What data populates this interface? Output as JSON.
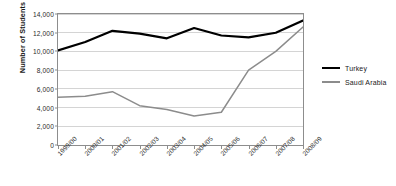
{
  "chart_data": {
    "type": "line",
    "title": "",
    "xlabel": "",
    "ylabel": "Number of Students",
    "categories": [
      "1999/00",
      "2000/01",
      "2001/02",
      "2002/03",
      "2003/04",
      "2004/05",
      "2005/06",
      "2006/07",
      "2007/08",
      "2008/09"
    ],
    "series": [
      {
        "name": "Turkey",
        "color": "#000000",
        "width": 2.2,
        "values": [
          10100,
          11000,
          12200,
          11900,
          11400,
          12500,
          11700,
          11500,
          12000,
          13300
        ]
      },
      {
        "name": "Saudi Arabia",
        "color": "#8c8c8c",
        "width": 1.5,
        "values": [
          5100,
          5200,
          5700,
          4200,
          3800,
          3100,
          3500,
          8000,
          10000,
          12600
        ]
      }
    ],
    "ylim": [
      0,
      14000
    ],
    "yticks": [
      0,
      2000,
      4000,
      6000,
      8000,
      10000,
      12000,
      14000
    ],
    "ytick_labels": [
      "0",
      "2,000",
      "4,000",
      "6,000",
      "8,000",
      "10,000",
      "12,000",
      "14,000"
    ],
    "grid": true,
    "grid_color": "#d4d4d4",
    "axis_color": "#8d8d8d",
    "legend_position": "right",
    "background": "#ffffff"
  }
}
